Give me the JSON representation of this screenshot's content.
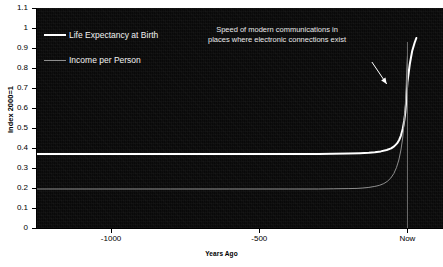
{
  "chart_data": {
    "type": "line",
    "title": "",
    "xlabel": "Years Ago",
    "ylabel": "Index 2000=1",
    "background": "#0a0a0a",
    "grid": false,
    "legend_position": "top-left",
    "xlim": [
      -1250,
      120
    ],
    "ylim": [
      0,
      1.1
    ],
    "xticks": [
      -1000,
      -500,
      0
    ],
    "xticklabels": [
      "-1000",
      "-500",
      "Now"
    ],
    "yticks": [
      0,
      0.1,
      0.2,
      0.3,
      0.4,
      0.5,
      0.6,
      0.7,
      0.8,
      0.9,
      1,
      1.1
    ],
    "yticklabels": [
      "0",
      "0.1",
      "0.2",
      "0.3",
      "0.4",
      "0.5",
      "0.6",
      "0.7",
      "0.8",
      "0.9",
      "1",
      "1.1"
    ],
    "series": [
      {
        "name": "Life Expectancy at Birth",
        "color": "#ffffff",
        "width": 2,
        "x": [
          -1250,
          -1000,
          -800,
          -600,
          -400,
          -300,
          -250,
          -200,
          -160,
          -130,
          -110,
          -90,
          -70,
          -55,
          -45,
          -35,
          -28,
          -22,
          -16,
          -11,
          -7,
          -4,
          -2,
          0,
          8,
          16,
          24,
          30
        ],
        "y": [
          0.37,
          0.37,
          0.37,
          0.37,
          0.37,
          0.37,
          0.371,
          0.372,
          0.374,
          0.376,
          0.379,
          0.383,
          0.39,
          0.398,
          0.408,
          0.423,
          0.44,
          0.462,
          0.495,
          0.535,
          0.58,
          0.635,
          0.685,
          0.73,
          0.82,
          0.885,
          0.925,
          0.95
        ]
      },
      {
        "name": "Income per Person",
        "color": "#8e8e8e",
        "width": 1,
        "x": [
          -1250,
          -1000,
          -800,
          -600,
          -400,
          -300,
          -250,
          -200,
          -170,
          -150,
          -130,
          -110,
          -95,
          -80,
          -68,
          -56,
          -46,
          -37,
          -29,
          -22,
          -16,
          -11,
          -7,
          -4,
          -2,
          0
        ],
        "y": [
          0.195,
          0.195,
          0.195,
          0.195,
          0.195,
          0.195,
          0.196,
          0.197,
          0.198,
          0.2,
          0.203,
          0.208,
          0.213,
          0.222,
          0.233,
          0.25,
          0.272,
          0.302,
          0.34,
          0.39,
          0.45,
          0.53,
          0.62,
          0.72,
          0.8,
          0.86
        ]
      }
    ],
    "vertical_reference_line": {
      "name": "now-line",
      "x": 0,
      "color": "#6f6f6f",
      "y_top": 0.93,
      "y_bottom": 0
    },
    "annotations": [
      {
        "name": "modern-communications-note",
        "lines": [
          "Speed of modern communications in",
          "places where electronic connections exist"
        ],
        "color": "#e8e8e8"
      }
    ],
    "arrow": {
      "name": "annotation-arrow",
      "from": [
        -120,
        0.83
      ],
      "to": [
        -70,
        0.72
      ],
      "color": "#ffffff"
    }
  },
  "legend": {
    "items": [
      {
        "label": "Life Expectancy at Birth",
        "style": "thick",
        "color": "#ffffff"
      },
      {
        "label": "Income per Person",
        "style": "thin",
        "color": "#8e8e8e"
      }
    ]
  },
  "axes": {
    "x_title": "Years Ago",
    "y_title": "Index 2000=1"
  }
}
